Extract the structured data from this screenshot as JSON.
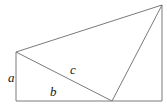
{
  "figure": {
    "background_color": "#ffffff",
    "stroke_color": "#7a7a7a",
    "label_color": "#1a1a1a",
    "stroke_width": 1,
    "width": 167,
    "height": 110,
    "labels": {
      "a": "a",
      "b": "b",
      "c": "c"
    },
    "label_positions": {
      "a": {
        "x": 8,
        "y": 82
      },
      "b": {
        "x": 50,
        "y": 96
      },
      "c": {
        "x": 70,
        "y": 74
      }
    },
    "label_font_size": 13,
    "vertices": {
      "top_left": {
        "x": 16,
        "y": 52
      },
      "top_right": {
        "x": 162,
        "y": 5
      },
      "bottom_right": {
        "x": 162,
        "y": 101
      },
      "bottom_left": {
        "x": 16,
        "y": 101
      },
      "bottom_mid": {
        "x": 112,
        "y": 101
      }
    },
    "segments": [
      {
        "name": "left-vertical-side-a",
        "label": "a",
        "x1": 16,
        "y1": 52,
        "x2": 16,
        "y2": 101
      },
      {
        "name": "bottom-side-b",
        "label": "b",
        "x1": 16,
        "y1": 101,
        "x2": 162,
        "y2": 101
      },
      {
        "name": "upper-left-diagonal",
        "label": "",
        "x1": 16,
        "y1": 52,
        "x2": 162,
        "y2": 5
      },
      {
        "name": "right-vertical-side",
        "label": "",
        "x1": 162,
        "y1": 5,
        "x2": 162,
        "y2": 101
      },
      {
        "name": "hypotenuse-c",
        "label": "c",
        "x1": 16,
        "y1": 52,
        "x2": 112,
        "y2": 101
      },
      {
        "name": "inner-diagonal",
        "label": "",
        "x1": 162,
        "y1": 5,
        "x2": 112,
        "y2": 101
      }
    ]
  }
}
